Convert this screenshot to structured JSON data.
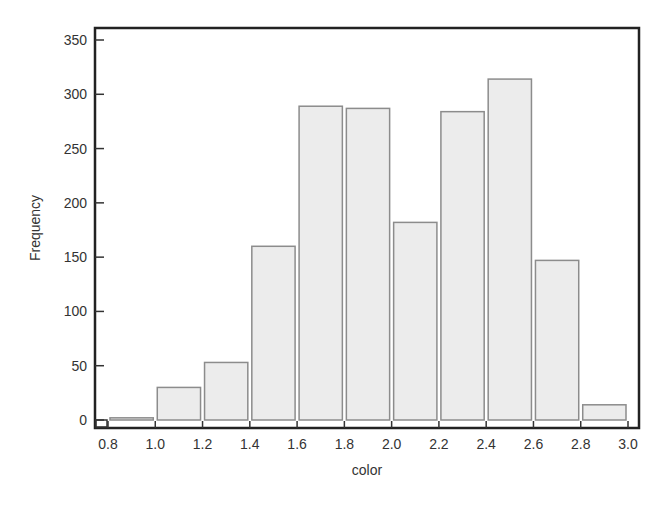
{
  "chart_data": {
    "type": "bar",
    "subtype": "histogram",
    "title": "",
    "xlabel": "color",
    "ylabel": "Frequency",
    "bins": [
      {
        "from": 0.8,
        "to": 1.0,
        "value": 2
      },
      {
        "from": 1.0,
        "to": 1.2,
        "value": 30
      },
      {
        "from": 1.2,
        "to": 1.4,
        "value": 53
      },
      {
        "from": 1.4,
        "to": 1.6,
        "value": 160
      },
      {
        "from": 1.6,
        "to": 1.8,
        "value": 289
      },
      {
        "from": 1.8,
        "to": 2.0,
        "value": 287
      },
      {
        "from": 2.0,
        "to": 2.2,
        "value": 182
      },
      {
        "from": 2.2,
        "to": 2.4,
        "value": 284
      },
      {
        "from": 2.4,
        "to": 2.6,
        "value": 314
      },
      {
        "from": 2.6,
        "to": 2.8,
        "value": 147
      },
      {
        "from": 2.8,
        "to": 3.0,
        "value": 14
      }
    ],
    "categories": [
      "0.8-1.0",
      "1.0-1.2",
      "1.2-1.4",
      "1.4-1.6",
      "1.6-1.8",
      "1.8-2.0",
      "2.0-2.2",
      "2.2-2.4",
      "2.4-2.6",
      "2.6-2.8",
      "2.8-3.0"
    ],
    "values": [
      2,
      30,
      53,
      160,
      289,
      287,
      182,
      284,
      314,
      147,
      14
    ],
    "xlim": [
      0.8,
      3.0
    ],
    "ylim": [
      0,
      360
    ],
    "x_ticks": [
      "0.8",
      "1.0",
      "1.2",
      "1.4",
      "1.6",
      "1.8",
      "2.0",
      "2.2",
      "2.4",
      "2.6",
      "2.8",
      "3.0"
    ],
    "y_ticks": [
      "0",
      "50",
      "100",
      "150",
      "200",
      "250",
      "300",
      "350"
    ],
    "grid": false,
    "legend": null,
    "colors": {
      "bar_fill": "#ececec",
      "bar_stroke": "#8c8c8c",
      "frame": "#222222",
      "text": "#333333"
    }
  }
}
